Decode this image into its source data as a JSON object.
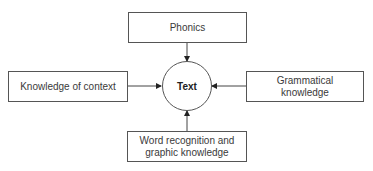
{
  "diagram": {
    "center": {
      "label": "Text"
    },
    "nodes": {
      "top": {
        "label": "Phonics"
      },
      "left": {
        "label": "Knowledge of context"
      },
      "right": {
        "label": "Grammatical knowledge"
      },
      "bottom": {
        "label": "Word recognition and graphic knowledge"
      }
    },
    "edges": [
      {
        "from": "Phonics",
        "to": "Text"
      },
      {
        "from": "Knowledge of context",
        "to": "Text"
      },
      {
        "from": "Grammatical knowledge",
        "to": "Text"
      },
      {
        "from": "Word recognition and graphic knowledge",
        "to": "Text"
      }
    ],
    "colors": {
      "stroke": "#555555",
      "text": "#3a3a3a",
      "background": "#ffffff"
    }
  }
}
